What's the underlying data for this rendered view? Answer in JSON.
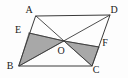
{
  "figure": {
    "kind": "geometry-diagram",
    "shape": "parallelogram",
    "background_color": "#fdfdfd",
    "line_color": "#3a3a3a",
    "shade_color": "#a8a8a8",
    "label_color": "#1a1a1a",
    "labels": {
      "a": "A",
      "b": "B",
      "c": "C",
      "d": "D",
      "e": "E",
      "f": "F",
      "o": "O"
    },
    "points": {
      "A": {
        "x": 36,
        "y": 16
      },
      "B": {
        "x": 19,
        "y": 66
      },
      "C": {
        "x": 92,
        "y": 66
      },
      "D": {
        "x": 110,
        "y": 15
      },
      "E": {
        "x": 29,
        "y": 33
      },
      "F": {
        "x": 99,
        "y": 47
      },
      "O": {
        "x": 64,
        "y": 41
      }
    },
    "label_positions": {
      "A": {
        "x": 29,
        "y": 13
      },
      "B": {
        "x": 10,
        "y": 69
      },
      "C": {
        "x": 96,
        "y": 73
      },
      "D": {
        "x": 114,
        "y": 13
      },
      "E": {
        "x": 18,
        "y": 33
      },
      "F": {
        "x": 105,
        "y": 46
      },
      "O": {
        "x": 61,
        "y": 54
      }
    },
    "edges": [
      {
        "name": "side-AD",
        "from": "A",
        "to": "D"
      },
      {
        "name": "side-DC",
        "from": "D",
        "to": "C"
      },
      {
        "name": "side-CB",
        "from": "C",
        "to": "B"
      },
      {
        "name": "side-BA",
        "from": "B",
        "to": "A"
      }
    ],
    "diagonals": [
      {
        "name": "diagonal-AC",
        "from": "A",
        "to": "C"
      },
      {
        "name": "diagonal-BD",
        "from": "B",
        "to": "D"
      }
    ],
    "cevians": [
      {
        "name": "segment-EO",
        "from": "E",
        "to": "O"
      },
      {
        "name": "segment-OF",
        "from": "O",
        "to": "F"
      }
    ],
    "shaded_regions": [
      {
        "name": "triangle-BEO",
        "vertices": [
          "B",
          "E",
          "O"
        ]
      },
      {
        "name": "triangle-OFC",
        "vertices": [
          "O",
          "F",
          "C"
        ]
      }
    ]
  }
}
